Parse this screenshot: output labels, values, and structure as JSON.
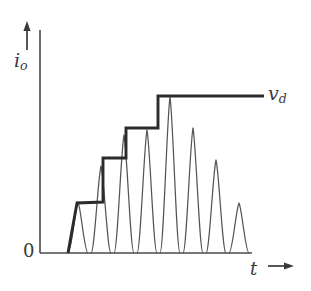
{
  "figure": {
    "title": "",
    "y_axis_label": "i",
    "y_axis_label_sub": "o",
    "x_axis_label": "t",
    "origin_label": "0",
    "envelope_label": "v",
    "envelope_label_sub": "d",
    "x_axis_arrow": "→",
    "y_axis_arrow": "↑",
    "line_color": "#3a3a3a",
    "envelope_color": "#2b2b2b",
    "background_color": "#ffffff"
  },
  "chart_data": {
    "type": "line",
    "title": "",
    "xlabel": "t",
    "ylabel": "i_o",
    "grid": false,
    "legend": [
      {
        "name": "i_o",
        "style": "thin pulse train"
      },
      {
        "name": "v_d",
        "style": "thick stepped envelope"
      }
    ],
    "annotations": [
      {
        "text": "v_d",
        "x": 290,
        "y": 244,
        "desc": "label on thick stepped envelope line"
      },
      {
        "text": "0",
        "x": 0,
        "y": 0,
        "desc": "origin label"
      }
    ],
    "axis_px": {
      "x_axis_y": 253,
      "y_axis_x": 40,
      "x_axis_end": 250,
      "y_axis_top": 28
    },
    "xlim": [
      0,
      311
    ],
    "ylim": [
      0,
      291
    ],
    "pulses": [
      {
        "index": 1,
        "x_start": 68,
        "x_end": 88,
        "peak_x": 78,
        "peak_y_px": 202,
        "amplitude": 51
      },
      {
        "index": 2,
        "x_start": 91,
        "x_end": 111,
        "peak_x": 101,
        "peak_y_px": 166,
        "amplitude": 87
      },
      {
        "index": 3,
        "x_start": 114,
        "x_end": 134,
        "peak_x": 124,
        "peak_y_px": 135,
        "amplitude": 118
      },
      {
        "index": 4,
        "x_start": 137,
        "x_end": 157,
        "peak_x": 147,
        "peak_y_px": 130,
        "amplitude": 123
      },
      {
        "index": 5,
        "x_start": 160,
        "x_end": 180,
        "peak_x": 170,
        "peak_y_px": 97,
        "amplitude": 156
      },
      {
        "index": 6,
        "x_start": 183,
        "x_end": 203,
        "peak_x": 193,
        "peak_y_px": 128,
        "amplitude": 125
      },
      {
        "index": 7,
        "x_start": 206,
        "x_end": 226,
        "peak_x": 216,
        "peak_y_px": 160,
        "amplitude": 93
      },
      {
        "index": 8,
        "x_start": 229,
        "x_end": 249,
        "peak_x": 239,
        "peak_y_px": 203,
        "amplitude": 50
      }
    ],
    "envelope_steps": [
      {
        "index": 1,
        "x_start": 68,
        "x_end": 103,
        "level_y_px": 202,
        "value": 51
      },
      {
        "index": 2,
        "x_start": 103,
        "x_end": 126,
        "level_y_px": 158,
        "value": 95
      },
      {
        "index": 3,
        "x_start": 126,
        "x_end": 158,
        "level_y_px": 128,
        "value": 125
      },
      {
        "index": 4,
        "x_start": 158,
        "x_end": 248,
        "level_y_px": 96,
        "value": 157
      }
    ]
  }
}
